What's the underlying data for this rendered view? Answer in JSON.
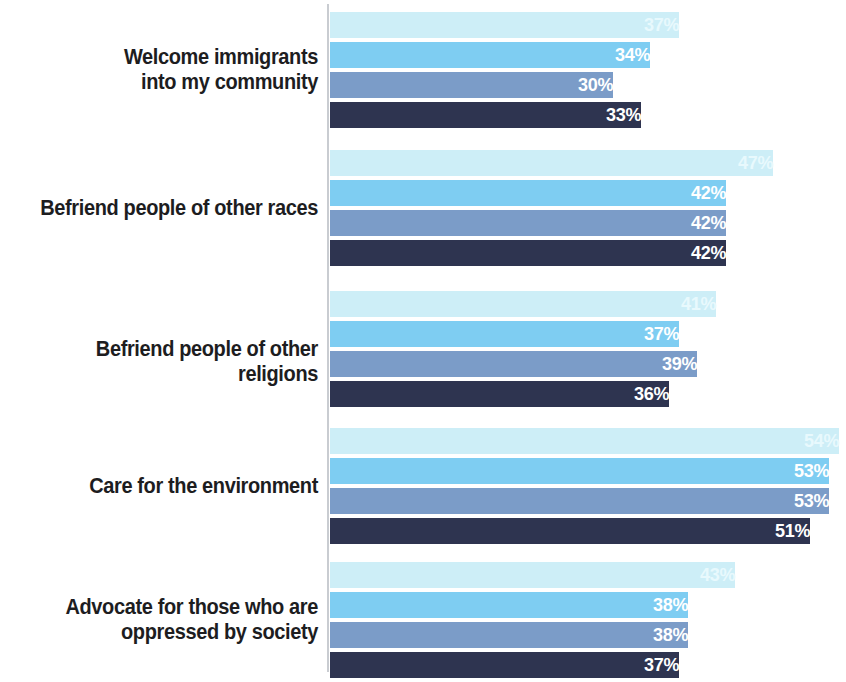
{
  "chart_data": {
    "type": "bar",
    "orientation": "horizontal",
    "title": "",
    "subtitle": "",
    "xlabel": "",
    "ylabel": "",
    "grid": false,
    "legend": "none",
    "axis_line": true,
    "xlim": [
      0,
      54
    ],
    "value_suffix": "%",
    "categories": [
      "Welcome immigrants\ninto my community",
      "Befriend people of other races",
      "Befriend people of other religions",
      "Care for the environment",
      "Advocate for those who are\noppressed by society"
    ],
    "series": [
      {
        "name": "series-1",
        "color": "#cdeef7",
        "values": [
          37,
          47,
          41,
          54,
          43
        ]
      },
      {
        "name": "series-2",
        "color": "#7ecdf2",
        "values": [
          34,
          42,
          37,
          53,
          38
        ]
      },
      {
        "name": "series-3",
        "color": "#7b9cc8",
        "values": [
          30,
          42,
          39,
          53,
          38
        ]
      },
      {
        "name": "series-4",
        "color": "#2e3450",
        "values": [
          33,
          42,
          36,
          51,
          37
        ]
      }
    ],
    "value_labels": [
      [
        "37%",
        "34%",
        "30%",
        "33%"
      ],
      [
        "47%",
        "42%",
        "42%",
        "42%"
      ],
      [
        "41%",
        "37%",
        "39%",
        "36%"
      ],
      [
        "54%",
        "53%",
        "53%",
        "51%"
      ],
      [
        "43%",
        "38%",
        "38%",
        "37%"
      ]
    ]
  },
  "layout": {
    "plot_left_px": 330,
    "axis_x_px": 327,
    "px_per_percent": 9.42,
    "bar_height_px": 26,
    "bar_gap_px": 4,
    "group_tops_px": [
      12,
      150,
      291,
      428,
      562
    ],
    "label_column_width_px": 318
  }
}
